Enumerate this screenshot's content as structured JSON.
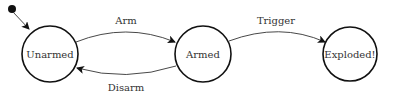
{
  "diagram": {
    "type": "state-machine",
    "initial_state": "Unarmed",
    "states": [
      {
        "id": "unarmed",
        "label": "Unarmed"
      },
      {
        "id": "armed",
        "label": "Armed"
      },
      {
        "id": "exploded",
        "label": "Exploded!"
      }
    ],
    "transitions": [
      {
        "from": "unarmed",
        "to": "armed",
        "label": "Arm"
      },
      {
        "from": "armed",
        "to": "unarmed",
        "label": "Disarm"
      },
      {
        "from": "armed",
        "to": "exploded",
        "label": "Trigger"
      }
    ],
    "colors": {
      "stroke": "#111111",
      "text": "#333333",
      "background": "#ffffff"
    }
  }
}
